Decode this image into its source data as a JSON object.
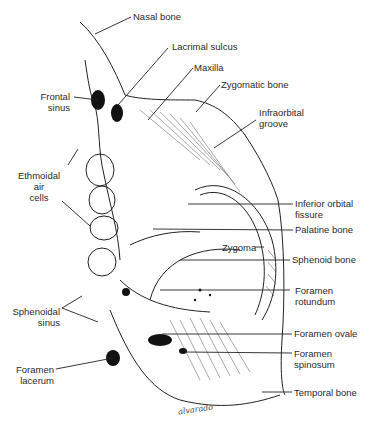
{
  "figure": {
    "type": "anatomical illustration",
    "signature": "alvarado"
  },
  "labels": {
    "nasal_bone": "Nasal bone",
    "lacrimal_sulcus": "Lacrimal sulcus",
    "maxilla": "Maxilla",
    "zygomatic_bone": "Zygomatic bone",
    "frontal_sinus_1": "Frontal",
    "frontal_sinus_2": "sinus",
    "infraorbital_groove_1": "Infraorbital",
    "infraorbital_groove_2": "groove",
    "ethmoidal_1": "Ethmoidal",
    "ethmoidal_2": "air",
    "ethmoidal_3": "cells",
    "inferior_orbital_fissure_1": "Inferior orbital",
    "inferior_orbital_fissure_2": "fissure",
    "palatine_bone": "Palatine bone",
    "zygoma": "Zygoma",
    "sphenoid_bone": "Sphenoid bone",
    "foramen_rotundum_1": "Foramen",
    "foramen_rotundum_2": "rotundum",
    "sphenoidal_sinus_1": "Sphenoidal",
    "sphenoidal_sinus_2": "sinus",
    "foramen_ovale": "Foramen ovale",
    "foramen_spinosum_1": "Foramen",
    "foramen_spinosum_2": "spinosum",
    "foramen_lacerum_1": "Foramen",
    "foramen_lacerum_2": "lacerum",
    "temporal_bone": "Temporal bone"
  }
}
